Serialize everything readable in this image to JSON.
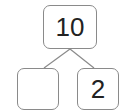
{
  "number_bond": {
    "whole": "10",
    "part_left": "",
    "part_right": "2"
  },
  "colors": {
    "border": "#8a8a8a",
    "text": "#222222"
  }
}
